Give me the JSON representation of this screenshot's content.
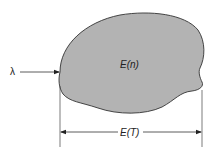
{
  "diagram": {
    "input_label": "λ",
    "region_label": "E(n)",
    "dimension_label": "E(T)",
    "colors": {
      "region_fill": "#b3b3b3",
      "outline": "#333333",
      "line": "#333333"
    }
  }
}
